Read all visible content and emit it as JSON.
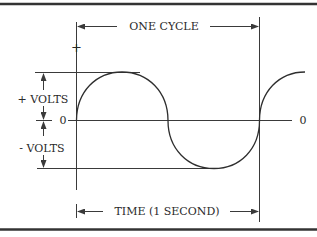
{
  "diagram": {
    "title_label": "ONE CYCLE",
    "time_label": "TIME (1 SECOND)",
    "plus_volts_label": "+ VOLTS",
    "minus_volts_label": "- VOLTS",
    "zero_label_left": "0",
    "zero_label_right": "0",
    "plus_sign": "+",
    "colors": {
      "line": "#3a3a3a",
      "background": "#ffffff",
      "text": "#2a2a2a"
    },
    "wave": {
      "type": "sine",
      "cycles_shown": "1 full cycle plus start of next",
      "period_label": "1 second"
    }
  }
}
